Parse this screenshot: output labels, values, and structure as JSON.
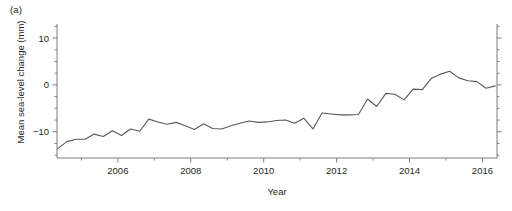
{
  "figure": {
    "panel_label": "(a)",
    "line_color": "#595959",
    "axis_color": "#6e6e6e"
  },
  "chart_data": {
    "type": "line",
    "title": "",
    "subtitle": "",
    "panel_label": "(a)",
    "xlabel": "Year",
    "ylabel": "Mean sea-level change (mm)",
    "xlim": [
      2004.33,
      2016.4
    ],
    "ylim": [
      -15.6,
      13.0
    ],
    "grid": false,
    "legend": null,
    "xticks": [
      2006,
      2008,
      2010,
      2012,
      2014,
      2016
    ],
    "xtick_labels": [
      "2006",
      "2008",
      "2010",
      "2012",
      "2014",
      "2016"
    ],
    "xminor_ticks": [
      2005,
      2007,
      2009,
      2011,
      2013,
      2015
    ],
    "yticks": [
      -10,
      0,
      10
    ],
    "ytick_labels": [
      "−10",
      "0",
      "10"
    ],
    "yminor_ticks": [
      -15,
      -12.5,
      -7.5,
      -5,
      -2.5,
      2.5,
      5,
      7.5,
      12.5
    ],
    "right_axis_ticks": true,
    "series": [
      {
        "name": "Mean sea-level change",
        "units": "mm",
        "x": [
          2004.35,
          2004.6,
          2004.85,
          2005.1,
          2005.35,
          2005.6,
          2005.85,
          2006.1,
          2006.35,
          2006.6,
          2006.85,
          2007.1,
          2007.35,
          2007.6,
          2007.85,
          2008.1,
          2008.35,
          2008.6,
          2008.85,
          2009.1,
          2009.35,
          2009.6,
          2009.85,
          2010.1,
          2010.35,
          2010.6,
          2010.85,
          2011.1,
          2011.35,
          2011.6,
          2011.85,
          2012.1,
          2012.35,
          2012.6,
          2012.85,
          2013.1,
          2013.35,
          2013.6,
          2013.85,
          2014.1,
          2014.35,
          2014.6,
          2014.85,
          2015.1,
          2015.35,
          2015.6,
          2015.85,
          2016.1,
          2016.35
        ],
        "y": [
          -13.6,
          -12.1,
          -11.6,
          -11.6,
          -10.5,
          -11.0,
          -9.8,
          -10.8,
          -9.4,
          -9.9,
          -7.3,
          -7.9,
          -8.4,
          -8.0,
          -8.7,
          -9.5,
          -8.3,
          -9.3,
          -9.4,
          -8.7,
          -8.2,
          -7.7,
          -8.0,
          -7.9,
          -7.6,
          -7.5,
          -8.2,
          -7.1,
          -9.4,
          -6.0,
          -6.2,
          -6.4,
          -6.4,
          -6.3,
          -3.0,
          -4.6,
          -1.8,
          -2.0,
          -3.2,
          -0.9,
          -1.0,
          1.4,
          2.3,
          2.9,
          1.5,
          0.9,
          0.7,
          -0.7,
          -0.2
        ]
      }
    ]
  }
}
